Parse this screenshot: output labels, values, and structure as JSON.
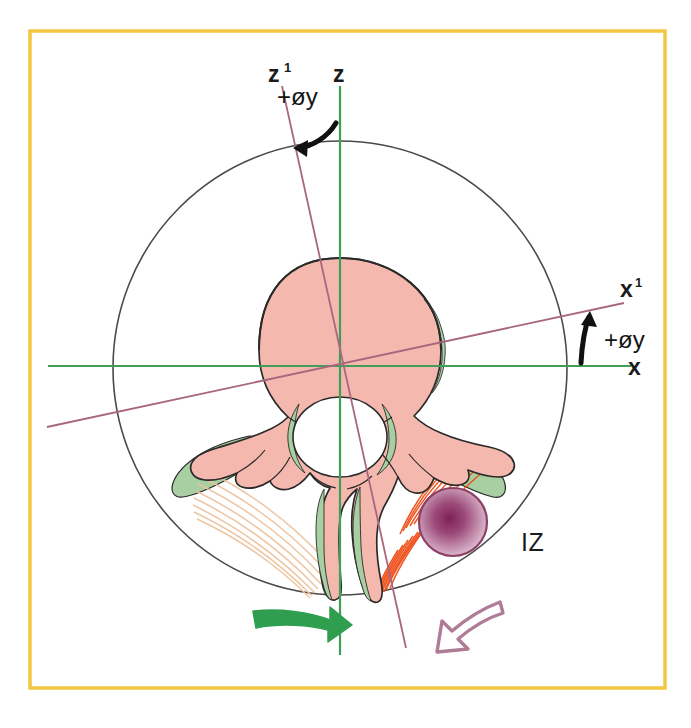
{
  "figure": {
    "background_color": "#ffffff",
    "frame_color": "#f2c744",
    "frame": {
      "x": 29,
      "y": 30,
      "width": 636,
      "height": 658
    }
  },
  "labels": {
    "z_prime": {
      "text": "z",
      "superscript": "1",
      "x": 277,
      "y": 75
    },
    "z": {
      "text": "z",
      "x": 341,
      "y": 75
    },
    "angle_top": {
      "text": "+øy",
      "x": 297,
      "y": 100
    },
    "x_prime": {
      "text": "x",
      "superscript": "1",
      "x": 627,
      "y": 291
    },
    "angle_right": {
      "text": "+øy",
      "x": 608,
      "y": 340
    },
    "x": {
      "text": "x",
      "x": 633,
      "y": 375
    },
    "iz": {
      "text": "IZ",
      "x": 528,
      "y": 550
    }
  },
  "geometry": {
    "origin": {
      "x": 340,
      "y": 367
    },
    "outer_circle": {
      "cx": 340,
      "cy": 368,
      "r": 227,
      "stroke": "#4a4a4a"
    },
    "axes": {
      "z_axis": {
        "x1": 340,
        "y1": 86,
        "x2": 340,
        "y2": 655,
        "color": "#3f9e57"
      },
      "x_axis": {
        "x1": 48,
        "y1": 366,
        "x2": 631,
        "y2": 366,
        "color": "#3f9e57"
      },
      "z_prime_axis": {
        "x1": 282,
        "y1": 86,
        "x2": 406,
        "y2": 648,
        "color": "#a8677f"
      },
      "x_prime_axis": {
        "x1": 47,
        "y1": 427,
        "x2": 624,
        "y2": 303,
        "color": "#a8677f"
      }
    },
    "rotation_angle_deg": 12
  },
  "anatomy": {
    "vertebral_body": {
      "fill": "#f5b8ae",
      "stroke": "#2a2a2a",
      "cx": 340,
      "cy": 350,
      "rx": 98,
      "ry": 92
    },
    "posterior_shell": {
      "fill": "#a8cfa1"
    },
    "spinal_canal": {
      "fill": "#ffffff",
      "cx": 340,
      "cy": 430,
      "rx": 52,
      "ry": 44
    },
    "bone_fill": "#f5b8ae",
    "bone_outline": "#2a2a2a",
    "cartilage_fill": "#a8cfa1",
    "muscle_active_color": "#f04d16",
    "muscle_passive_color": "#f0c9a8",
    "nodule": {
      "cx": 453,
      "cy": 522,
      "r": 34,
      "center_color": "#7e2159",
      "mid_color": "#b06a9a",
      "outer_color": "#ddb8cf",
      "stroke": "#8d3f66"
    }
  },
  "arrows": {
    "green_arrow": {
      "color": "#2f9e4f",
      "direction": "right",
      "style": "solid",
      "tip": {
        "x": 344,
        "y": 626
      }
    },
    "purple_arrow": {
      "color": "#b07b96",
      "direction": "down-left",
      "style": "outline",
      "tip": {
        "x": 408,
        "y": 643
      }
    }
  }
}
